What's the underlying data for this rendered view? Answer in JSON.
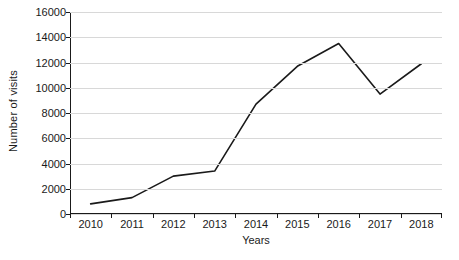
{
  "chart_data": {
    "type": "line",
    "title": "",
    "xlabel": "Years",
    "ylabel": "Number of visits",
    "categories": [
      "2010",
      "2011",
      "2012",
      "2013",
      "2014",
      "2015",
      "2016",
      "2017",
      "2018"
    ],
    "values": [
      800,
      1300,
      3000,
      3400,
      8700,
      11700,
      13500,
      9500,
      11900
    ],
    "series": [
      {
        "name": "Number of visits",
        "values": [
          800,
          1300,
          3000,
          3400,
          8700,
          11700,
          13500,
          9500,
          11900
        ]
      }
    ],
    "ylim": [
      0,
      16000
    ],
    "ytick_step": 2000,
    "yticks": [
      0,
      2000,
      4000,
      6000,
      8000,
      10000,
      12000,
      14000,
      16000
    ],
    "ytick_labels": [
      "0",
      "2000",
      "4000",
      "6000",
      "8000",
      "10000",
      "12000",
      "14000",
      "16000"
    ],
    "grid": true,
    "grid_axis": "y",
    "legend": false,
    "legend_position": "none",
    "line_color": "#1a1a1a",
    "grid_color": "#d8d8d8",
    "axis_color": "#1a1a1a",
    "background_color": "#ffffff",
    "markers": false
  }
}
